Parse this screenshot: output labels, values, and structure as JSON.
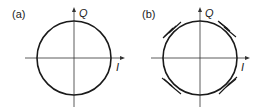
{
  "figure": {
    "panels": [
      {
        "label": "(a)",
        "description": "Constant-envelope constellation circle on I/Q axes",
        "x_axis_label": "I",
        "y_axis_label": "Q"
      },
      {
        "label": "(b)",
        "description": "Circle trajectory with spike distortions at 45°, 135°, 225°, 315°",
        "x_axis_label": "I",
        "y_axis_label": "Q"
      }
    ],
    "colors": {
      "stroke": "#1a1a1a",
      "background": "#ffffff"
    }
  }
}
